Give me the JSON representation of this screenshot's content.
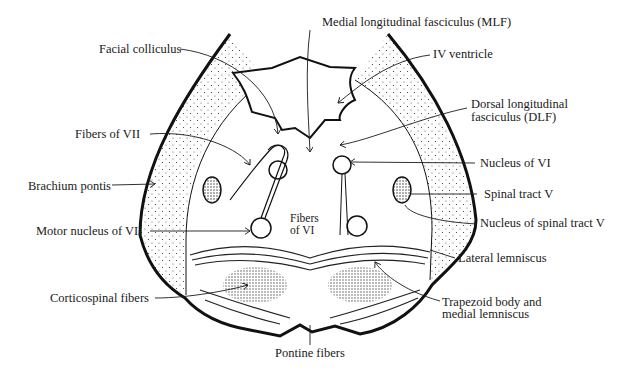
{
  "diagram": {
    "labels": {
      "mlf": "Medial longitudinal fasciculus (MLF)",
      "facial_colliculus": "Facial colliculus",
      "iv_ventricle": "IV ventricle",
      "dlf_line1": "Dorsal longitudinal",
      "dlf_line2": "fasciculus (DLF)",
      "fibers_vii": "Fibers of VII",
      "nucleus_vi": "Nucleus of VI",
      "brachium_pontis": "Brachium pontis",
      "spinal_tract_v": "Spinal tract V",
      "fibers_vi_line1": "Fibers",
      "fibers_vi_line2": "of VI",
      "nucleus_spinal_tract_v": "Nucleus of spinal tract V",
      "motor_nucleus_vii": "Motor nucleus of VII",
      "lateral_lemniscus": "Lateral lemniscus",
      "corticospinal": "Corticospinal fibers",
      "trapezoid_line1": "Trapezoid body and",
      "trapezoid_line2": "medial lemniscus",
      "pontine_fibers": "Pontine fibers"
    },
    "colors": {
      "ink": "#1a1a1a",
      "background": "#ffffff"
    }
  }
}
